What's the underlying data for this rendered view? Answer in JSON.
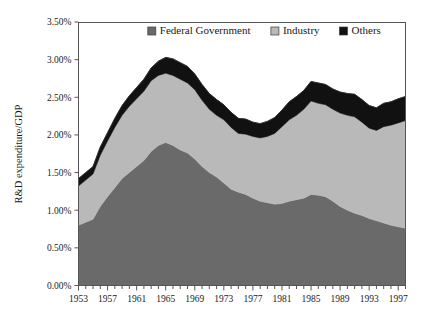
{
  "chart_data": {
    "type": "area",
    "stacked": true,
    "title": "",
    "xlabel": "",
    "ylabel": "R&D expenditure/GDP",
    "ylim": [
      0,
      3.5
    ],
    "ytick_labels": [
      "0.00%",
      "0.50%",
      "1.00%",
      "1.50%",
      "2.00%",
      "2.50%",
      "3.00%",
      "3.50%"
    ],
    "ytick_values": [
      0,
      0.5,
      1.0,
      1.5,
      2.0,
      2.5,
      3.0,
      3.5
    ],
    "xlim": [
      1953,
      1998
    ],
    "xtick_labels": [
      "1953",
      "1957",
      "1961",
      "1965",
      "1969",
      "1973",
      "1977",
      "1981",
      "1985",
      "1989",
      "1993",
      "1997"
    ],
    "xtick_values": [
      1953,
      1957,
      1961,
      1965,
      1969,
      1973,
      1977,
      1981,
      1985,
      1989,
      1993,
      1997
    ],
    "grid": false,
    "legend_position": "top-center",
    "x": [
      1953,
      1954,
      1955,
      1956,
      1957,
      1958,
      1959,
      1960,
      1961,
      1962,
      1963,
      1964,
      1965,
      1966,
      1967,
      1968,
      1969,
      1970,
      1971,
      1972,
      1973,
      1974,
      1975,
      1976,
      1977,
      1978,
      1979,
      1980,
      1981,
      1982,
      1983,
      1984,
      1985,
      1986,
      1987,
      1988,
      1989,
      1990,
      1991,
      1992,
      1993,
      1994,
      1995,
      1996,
      1997,
      1998
    ],
    "series": [
      {
        "name": "Federal Government",
        "color": "#6a6a6a",
        "values": [
          0.8,
          0.84,
          0.88,
          1.05,
          1.18,
          1.3,
          1.42,
          1.5,
          1.58,
          1.66,
          1.78,
          1.86,
          1.9,
          1.86,
          1.8,
          1.76,
          1.68,
          1.58,
          1.5,
          1.44,
          1.36,
          1.28,
          1.24,
          1.21,
          1.16,
          1.12,
          1.1,
          1.08,
          1.09,
          1.12,
          1.14,
          1.16,
          1.21,
          1.2,
          1.18,
          1.12,
          1.05,
          1.0,
          0.96,
          0.93,
          0.89,
          0.86,
          0.83,
          0.8,
          0.78,
          0.76
        ]
      },
      {
        "name": "Industry",
        "color": "#b9b9b9",
        "values": [
          0.52,
          0.56,
          0.6,
          0.68,
          0.74,
          0.8,
          0.84,
          0.88,
          0.9,
          0.92,
          0.94,
          0.93,
          0.92,
          0.93,
          0.94,
          0.93,
          0.92,
          0.88,
          0.84,
          0.82,
          0.84,
          0.82,
          0.78,
          0.8,
          0.82,
          0.84,
          0.88,
          0.94,
          1.02,
          1.08,
          1.12,
          1.18,
          1.24,
          1.22,
          1.22,
          1.22,
          1.24,
          1.26,
          1.28,
          1.24,
          1.2,
          1.2,
          1.28,
          1.33,
          1.38,
          1.43
        ]
      },
      {
        "name": "Others",
        "color": "#111111",
        "values": [
          0.1,
          0.1,
          0.1,
          0.11,
          0.11,
          0.12,
          0.13,
          0.14,
          0.15,
          0.16,
          0.17,
          0.19,
          0.21,
          0.22,
          0.22,
          0.22,
          0.21,
          0.21,
          0.21,
          0.21,
          0.2,
          0.2,
          0.2,
          0.2,
          0.19,
          0.19,
          0.2,
          0.21,
          0.22,
          0.24,
          0.25,
          0.25,
          0.26,
          0.27,
          0.27,
          0.27,
          0.28,
          0.29,
          0.3,
          0.3,
          0.3,
          0.3,
          0.31,
          0.31,
          0.32,
          0.32
        ]
      }
    ],
    "totals": [
      1.42,
      1.5,
      1.58,
      1.84,
      2.03,
      2.22,
      2.39,
      2.52,
      2.63,
      2.74,
      2.89,
      2.98,
      3.03,
      3.01,
      2.96,
      2.91,
      2.81,
      2.67,
      2.55,
      2.47,
      2.4,
      2.3,
      2.22,
      2.21,
      2.17,
      2.15,
      2.18,
      2.23,
      2.33,
      2.44,
      2.51,
      2.59,
      2.71,
      2.69,
      2.67,
      2.61,
      2.57,
      2.55,
      2.54,
      2.47,
      2.39,
      2.36,
      2.42,
      2.44,
      2.48,
      2.51
    ]
  },
  "legend": {
    "items": [
      {
        "label": "Federal Government",
        "color": "#6a6a6a"
      },
      {
        "label": "Industry",
        "color": "#b9b9b9"
      },
      {
        "label": "Others",
        "color": "#111111"
      }
    ]
  }
}
